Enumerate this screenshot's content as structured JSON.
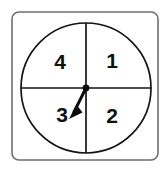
{
  "figure": {
    "name": "spinner-wheel",
    "type": "four-sector-spinner",
    "canvas": {
      "width": 167,
      "height": 170,
      "background": "#ffffff"
    }
  },
  "frame": {
    "name": "outer-frame",
    "x": 12,
    "y": 12,
    "width": 146,
    "height": 148,
    "corner_radius": 7,
    "stroke": "#6f6f6f",
    "stroke_width": 1.6,
    "fill": "#ffffff"
  },
  "circle": {
    "name": "spinner-circle",
    "cx": 86,
    "cy": 88,
    "r": 65,
    "stroke": "#141414",
    "stroke_width": 1.7,
    "fill": "#ffffff"
  },
  "dividers": [
    {
      "name": "vertical-divider",
      "x1": 86,
      "y1": 23,
      "x2": 86,
      "y2": 153,
      "stroke": "#141414",
      "stroke_width": 1.7
    },
    {
      "name": "horizontal-divider",
      "x1": 21,
      "y1": 88,
      "x2": 151,
      "y2": 88,
      "stroke": "#141414",
      "stroke_width": 1.7
    }
  ],
  "sectors": [
    {
      "label": "1",
      "position": "top-right",
      "x": 112,
      "y": 61,
      "angle_range_deg": [
        0,
        90
      ]
    },
    {
      "label": "2",
      "position": "bottom-right",
      "x": 112,
      "y": 116,
      "angle_range_deg": [
        270,
        360
      ]
    },
    {
      "label": "3",
      "position": "bottom-left",
      "x": 62,
      "y": 115,
      "angle_range_deg": [
        180,
        270
      ]
    },
    {
      "label": "4",
      "position": "top-left",
      "x": 60,
      "y": 62,
      "angle_range_deg": [
        90,
        180
      ]
    }
  ],
  "arrow": {
    "name": "spinner-needle",
    "pointing_at_sector": "3",
    "pivot": {
      "cx": 86,
      "cy": 88,
      "r": 3.4
    },
    "tip": {
      "x": 69,
      "y": 119
    },
    "stroke": "#0b0b0b",
    "stroke_width": 3.0,
    "head_points": "69,119 82,112 77,105",
    "fill": "#0b0b0b"
  },
  "colors": {
    "ink": "#141414",
    "frame_gray": "#6f6f6f",
    "paper": "#ffffff"
  }
}
